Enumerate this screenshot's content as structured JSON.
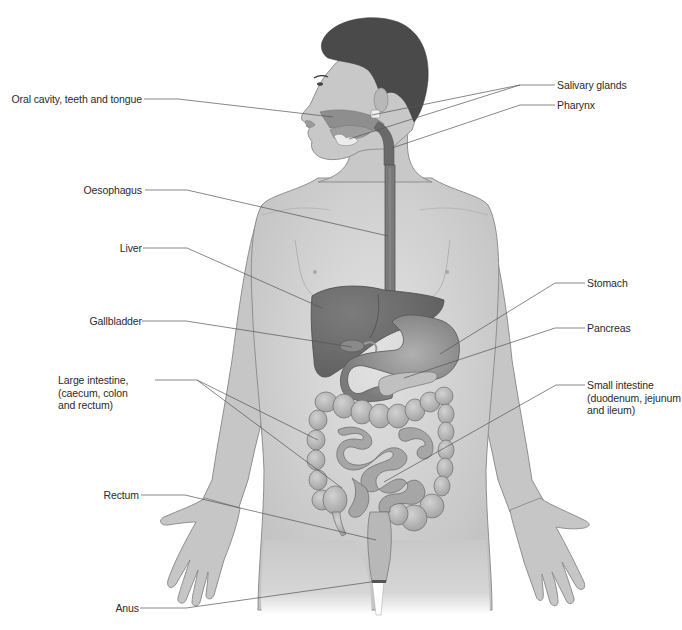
{
  "diagram": {
    "colors": {
      "skin": "#c8c8c8",
      "skin_outline": "#8f8f8f",
      "hair": "#4a4a4a",
      "organ_dark": "#6e6e6e",
      "organ_mid": "#8c8c8c",
      "intestine": "#b3b3b3",
      "leader_line": "#555555",
      "label_text": "#2a2a2a"
    },
    "labels_left": [
      {
        "id": "oral-cavity",
        "text": "Oral cavity, teeth and tongue"
      },
      {
        "id": "oesophagus",
        "text": "Oesophagus"
      },
      {
        "id": "liver",
        "text": "Liver"
      },
      {
        "id": "gallbladder",
        "text": "Gallbladder"
      },
      {
        "id": "large-intestine",
        "text": "Large intestine,\n(caecum, colon\nand rectum)"
      },
      {
        "id": "rectum",
        "text": "Rectum"
      },
      {
        "id": "anus",
        "text": "Anus"
      }
    ],
    "labels_right": [
      {
        "id": "salivary-glands",
        "text": "Salivary glands"
      },
      {
        "id": "pharynx",
        "text": "Pharynx"
      },
      {
        "id": "stomach",
        "text": "Stomach"
      },
      {
        "id": "pancreas",
        "text": "Pancreas"
      },
      {
        "id": "small-intestine",
        "text": "Small intestine\n(duodenum, jejunum\nand ileum)"
      }
    ]
  }
}
